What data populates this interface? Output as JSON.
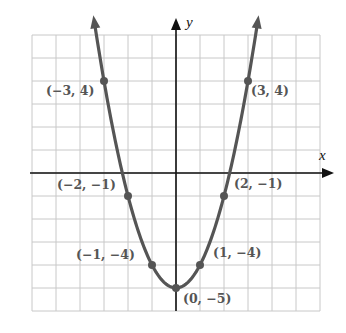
{
  "graph": {
    "title": "",
    "axes": {
      "x_label": "x",
      "y_label": "y"
    },
    "grid": {
      "x_min": -6,
      "x_max": 6,
      "y_min": -6,
      "y_max": 6,
      "step": 1
    },
    "colors": {
      "curve": "#555555",
      "grid": "#c8c8c8",
      "axis": "#111111",
      "label": "#555555"
    },
    "points": [
      {
        "x": -3,
        "y": 4,
        "label": "(−3, 4)"
      },
      {
        "x": -2,
        "y": -1,
        "label": "(−2, −1)"
      },
      {
        "x": -1,
        "y": -4,
        "label": "(−1, −4)"
      },
      {
        "x": 0,
        "y": -5,
        "label": "(0, −5)"
      },
      {
        "x": 1,
        "y": -4,
        "label": "(1, −4)"
      },
      {
        "x": 2,
        "y": -1,
        "label": "(2, −1)"
      },
      {
        "x": 3,
        "y": 4,
        "label": "(3, 4)"
      }
    ]
  },
  "chart_data": {
    "type": "line",
    "title": "",
    "xlabel": "x",
    "ylabel": "y",
    "function": "y = x^2 - 5",
    "x": [
      -3,
      -2,
      -1,
      0,
      1,
      2,
      3
    ],
    "values": [
      4,
      -1,
      -4,
      -5,
      -4,
      -1,
      4
    ],
    "labels": [
      "(−3, 4)",
      "(−2, −1)",
      "(−1, −4)",
      "(0, −5)",
      "(1, −4)",
      "(2, −1)",
      "(3, 4)"
    ],
    "xlim": [
      -6,
      6
    ],
    "ylim": [
      -6,
      6
    ],
    "grid": true,
    "legend": null
  }
}
